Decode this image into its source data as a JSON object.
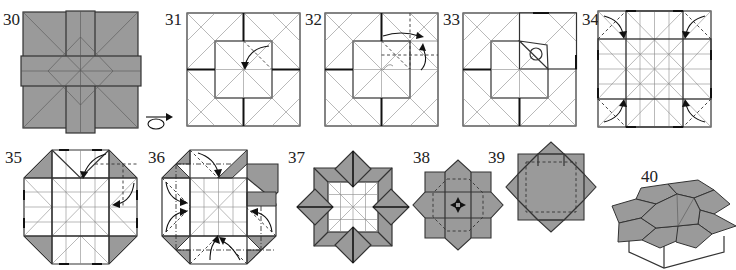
{
  "diagram": {
    "type": "origami folding instructions",
    "colors": {
      "paper_colored_side": "#9a9a9a",
      "paper_white_side": "#ffffff",
      "lines": "#333333"
    },
    "steps": [
      {
        "number": "30",
        "description": "Colored-side square with crossed vertical and horizontal bands and diagonal creases",
        "symbols": []
      },
      {
        "number": "31",
        "description": "Model turned over; white square with inner square, valley-fold corner to center",
        "symbols": [
          "turn-over-icon",
          "fold-arrow",
          "valley-fold-line"
        ]
      },
      {
        "number": "32",
        "description": "Squash-fold upper right section along dashed creases",
        "symbols": [
          "fold-arrow",
          "fold-arrow",
          "valley-fold-line"
        ]
      },
      {
        "number": "33",
        "description": "Result of squash; circle indicates point to attend",
        "symbols": [
          "circle-marker"
        ]
      },
      {
        "number": "34",
        "description": "Grid creased square; fold four corners inward",
        "symbols": [
          "fold-arrow",
          "fold-arrow",
          "fold-arrow",
          "fold-arrow"
        ]
      },
      {
        "number": "35",
        "description": "Octagon with gray corner triangles; fold flaps along edges",
        "symbols": [
          "fold-arrow",
          "fold-arrow"
        ]
      },
      {
        "number": "36",
        "description": "Repeat reverse folds on all sides",
        "symbols": [
          "fold-arrow",
          "fold-arrow",
          "fold-arrow",
          "fold-arrow",
          "fold-arrow",
          "fold-arrow"
        ]
      },
      {
        "number": "37",
        "description": "Square frame with four diamond points",
        "symbols": []
      },
      {
        "number": "38",
        "description": "Eight-pointed star; push center in and open",
        "symbols": [
          "push-arrows",
          "valley-fold-line"
        ]
      },
      {
        "number": "39",
        "description": "Completed eight-point star, top view",
        "symbols": []
      },
      {
        "number": "40",
        "description": "Finished box with star-shaped lid, perspective view",
        "symbols": []
      }
    ]
  }
}
